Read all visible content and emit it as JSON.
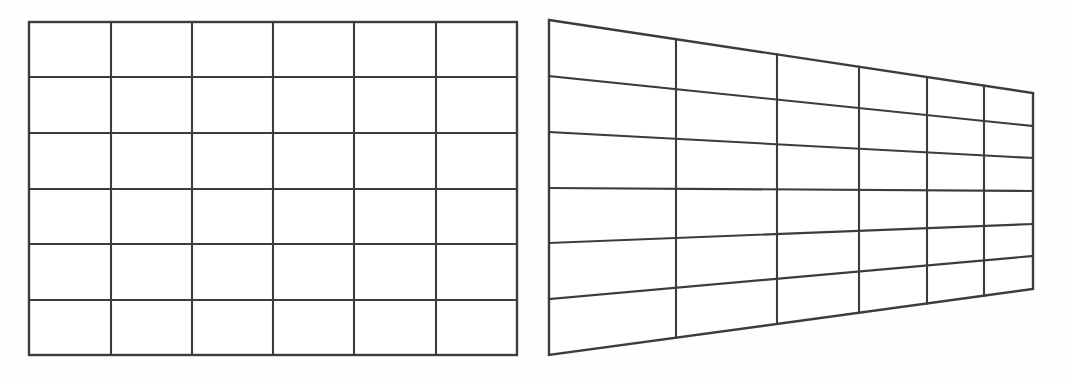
{
  "figure": {
    "background_color": "#fefefe",
    "line_color": "#3c3c3c",
    "fill_color": "#ffffff",
    "width": 1067,
    "height": 381,
    "panel_count": 2
  },
  "panels": [
    {
      "id": "left-panel",
      "name": "frontal-rectangular-grid",
      "caption": "",
      "projection": "orthographic",
      "rows": 6,
      "columns": 6,
      "bounds": {
        "left": 29,
        "top": 22,
        "right": 517,
        "bottom": 355
      },
      "vertical_line_x": [
        29,
        111,
        192,
        273,
        354,
        436,
        517
      ],
      "horizontal_line_y": [
        22,
        77,
        133,
        189,
        244,
        300,
        355
      ],
      "cell_width": 81.3,
      "cell_height": 55.5
    },
    {
      "id": "right-panel",
      "name": "one-point-perspective-grid",
      "caption": "",
      "projection": "one-point-perspective",
      "rows": 6,
      "columns": 6,
      "corners": {
        "top_left": {
          "x": 549,
          "y": 20
        },
        "top_right": {
          "x": 1033,
          "y": 93
        },
        "bottom_right": {
          "x": 1033,
          "y": 289
        },
        "bottom_left": {
          "x": 549,
          "y": 355
        }
      },
      "vertical_line_x": [
        549,
        676,
        777,
        859,
        927,
        984,
        1033
      ],
      "left_edge_horizontal_y": [
        20,
        76,
        132,
        188,
        243,
        299,
        355
      ],
      "right_edge_horizontal_y": [
        93,
        126,
        158,
        191,
        224,
        256,
        289
      ],
      "left_edge_height": 335,
      "right_edge_height": 196,
      "foreshortening_ratio": 0.585
    }
  ],
  "chart_data": {
    "type": "diagram",
    "xlabel": "",
    "ylabel": "",
    "grid": true,
    "legend_position": "none",
    "annotations": [],
    "series": [
      {
        "name": "frontal-rectangular-grid",
        "rows": 6,
        "columns": 6,
        "vertical_line_x": [
          29,
          111,
          192,
          273,
          354,
          436,
          517
        ],
        "horizontal_line_y": [
          22,
          77,
          133,
          189,
          244,
          300,
          355
        ]
      },
      {
        "name": "one-point-perspective-grid",
        "rows": 6,
        "columns": 6,
        "vertical_line_x": [
          549,
          676,
          777,
          859,
          927,
          984,
          1033
        ],
        "left_edge_horizontal_y": [
          20,
          76,
          132,
          188,
          243,
          299,
          355
        ],
        "right_edge_horizontal_y": [
          93,
          126,
          158,
          191,
          224,
          256,
          289
        ]
      }
    ]
  }
}
